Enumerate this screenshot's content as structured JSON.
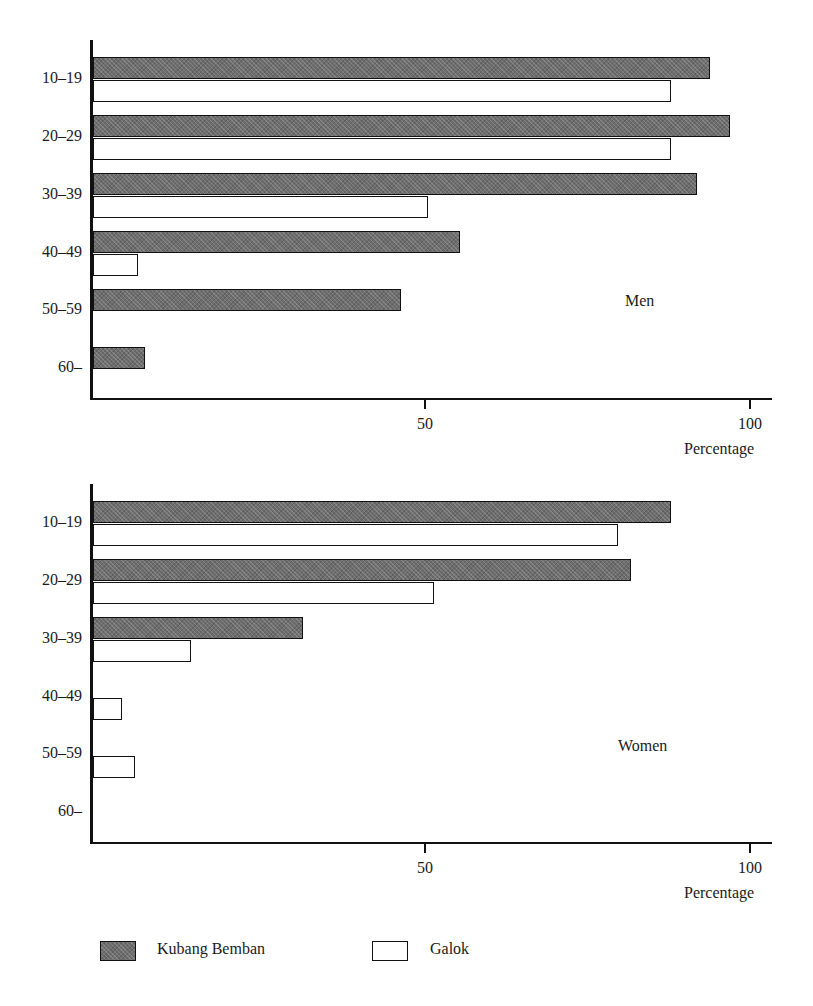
{
  "figure": {
    "legend": {
      "items": [
        {
          "key": "kb",
          "label": "Kubang Bemban",
          "fill": "#6e6e6e"
        },
        {
          "key": "gl",
          "label": "Galok",
          "fill": "#ffffff"
        }
      ]
    },
    "caption": ""
  },
  "chart_data": [
    {
      "type": "bar",
      "orientation": "horizontal",
      "title": "Men",
      "panel_label": "Men",
      "xlabel": "Percentage",
      "ylabel": "",
      "xlim": [
        0,
        100
      ],
      "xticks": [
        50,
        100
      ],
      "xticklabels": [
        "50",
        "100"
      ],
      "grid": false,
      "legend_position": "below-figure",
      "categories": [
        "10–19",
        "20–29",
        "30–39",
        "40–49",
        "50–59",
        "60–"
      ],
      "series": [
        {
          "name": "Kubang Bemban",
          "fill": "#6e6e6e",
          "values": [
            94,
            97,
            92,
            56,
            47,
            8
          ]
        },
        {
          "name": "Galok",
          "fill": "#ffffff",
          "values": [
            88,
            88,
            51,
            7,
            0,
            0
          ]
        }
      ]
    },
    {
      "type": "bar",
      "orientation": "horizontal",
      "title": "Women",
      "panel_label": "Women",
      "xlabel": "Percentage",
      "ylabel": "",
      "xlim": [
        0,
        100
      ],
      "xticks": [
        50,
        100
      ],
      "xticklabels": [
        "50",
        "100"
      ],
      "grid": false,
      "legend_position": "below-figure",
      "categories": [
        "10–19",
        "20–29",
        "30–39",
        "40–49",
        "50–59",
        "60–"
      ],
      "series": [
        {
          "name": "Kubang Bemban",
          "fill": "#6e6e6e",
          "values": [
            88,
            82,
            32,
            0,
            0,
            0
          ]
        },
        {
          "name": "Galok",
          "fill": "#ffffff",
          "values": [
            80,
            52,
            15,
            4.5,
            6.5,
            0
          ]
        }
      ]
    }
  ]
}
